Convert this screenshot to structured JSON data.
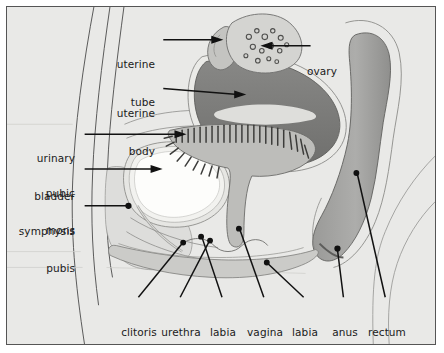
{
  "figure": {
    "background_color": "#e9e9e7",
    "frame_border_color": "#555555",
    "label_text_color": "#1a1a1a",
    "leader_line_color": "#111111"
  },
  "palette": {
    "uterus_fill": "#7d7d7d",
    "uterus_cavity": "#d9d9d6",
    "rectum_fill": "#a2a2a0",
    "vagina_fill": "#b9b9b6",
    "bladder_fill": "#fdfdfb",
    "ovary_fill": "#d2d2cf",
    "tissue_light": "#dedede",
    "tissue_mid": "#c9c9c6",
    "outline": "#4a4a4a"
  },
  "labels": {
    "uterine_tube": {
      "text": "uterine\ntube",
      "line1": "uterine",
      "line2": "tube",
      "align": "right",
      "x": 160,
      "y": 33
    },
    "ovary": {
      "text": "ovary",
      "line1": "ovary",
      "line2": "",
      "align": "left",
      "x": 312,
      "y": 40
    },
    "uterine_body": {
      "text": "uterine\nbody",
      "line1": "uterine",
      "line2": "body",
      "align": "right",
      "x": 160,
      "y": 80
    },
    "urinary_bladder": {
      "text": "urinary\nbladder",
      "line1": "urinary",
      "line2": "bladder",
      "align": "right",
      "x": 24,
      "y": 126
    },
    "pubic_symphysis": {
      "text": "pubic\nsymphysis",
      "line1": "pubic",
      "line2": "symphysis",
      "align": "right",
      "x": 14,
      "y": 161
    },
    "mons_pubis": {
      "text": "mons\npubis",
      "line1": "mons",
      "line2": "pubis",
      "align": "right",
      "x": 30,
      "y": 199
    },
    "clitoris": {
      "text": "clitoris",
      "line1": "clitoris",
      "line2": "",
      "align": "center",
      "x": 133,
      "y": 306
    },
    "urethra": {
      "text": "urethra",
      "line1": "urethra",
      "line2": "",
      "align": "center",
      "x": 176,
      "y": 306
    },
    "labia_minora": {
      "text": "labia\nminora",
      "line1": "labia",
      "line2": "minora",
      "align": "center",
      "x": 221,
      "y": 306
    },
    "vagina": {
      "text": "vagina",
      "line1": "vagina",
      "line2": "",
      "align": "center",
      "x": 262,
      "y": 306
    },
    "labia_majora": {
      "text": "labia\nmajora",
      "line1": "labia",
      "line2": "majora",
      "align": "center",
      "x": 302,
      "y": 306
    },
    "anus": {
      "text": "anus",
      "line1": "anus",
      "line2": "",
      "align": "center",
      "x": 342,
      "y": 306
    },
    "rectum": {
      "text": "rectum",
      "line1": "rectum",
      "line2": "",
      "align": "center",
      "x": 382,
      "y": 306
    }
  }
}
